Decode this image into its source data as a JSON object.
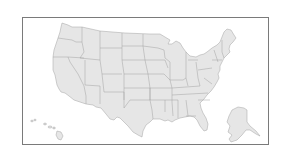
{
  "map": {
    "type": "us-states-outline",
    "fill_color": "#e6e6e6",
    "border_color": "#a3a3a3",
    "frame_color": "#7a7a7a",
    "regions": [
      "contiguous-us",
      "alaska",
      "hawaii"
    ]
  }
}
